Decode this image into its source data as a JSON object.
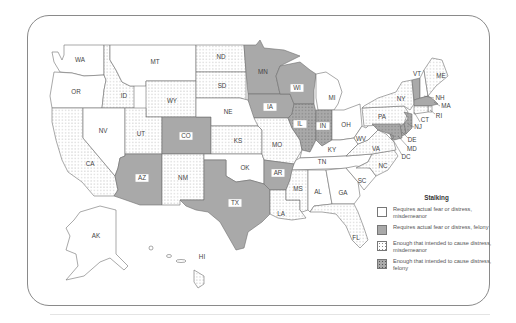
{
  "legend": {
    "title": "Stalking",
    "items": [
      {
        "key": "white",
        "label": "Requires actual fear or distress, misdemeanor"
      },
      {
        "key": "gray",
        "label": "Requires actual fear or distress, felony"
      },
      {
        "key": "dot",
        "label": "Enough that intended to cause distress, misdemeanor"
      },
      {
        "key": "graydot",
        "label": "Enough that intended to cause distress, felony"
      }
    ]
  },
  "colors": {
    "white": "#ffffff",
    "gray": "#a9a9a9",
    "dot_fill": "#8a8a8a",
    "border": "#6f6f6f",
    "frame": "#8a8a8a"
  },
  "states": {
    "WA": "white",
    "OR": "white",
    "MT": "white",
    "NV": "white",
    "NE": "white",
    "OK": "white",
    "MI": "white",
    "OH": "white",
    "KY": "white",
    "TN": "white",
    "WV": "white",
    "AL": "white",
    "GA": "white",
    "SC": "white",
    "NH": "white",
    "AK": "white",
    "MN": "gray",
    "WI": "gray",
    "IA": "gray",
    "CO": "gray",
    "AZ": "gray",
    "TX": "gray",
    "AR": "gray",
    "VT": "gray",
    "MA": "gray",
    "ID": "dot",
    "WY": "dot",
    "UT": "dot",
    "ND": "dot",
    "SD": "dot",
    "KS": "dot",
    "MO": "dot",
    "NM": "dot",
    "CA": "dot",
    "MS": "dot",
    "LA": "dot",
    "FL": "dot",
    "PA": "dot",
    "NY": "dot",
    "VA": "dot",
    "NC": "dot",
    "ME": "dot",
    "CT": "dot",
    "RI": "dot",
    "HI": "dot",
    "IL": "graydot",
    "IN": "graydot",
    "NJ": "graydot",
    "DE": "graydot",
    "MD": "graydot",
    "DC": "graydot"
  },
  "labels": {
    "WA": "WA",
    "OR": "OR",
    "CA": "CA",
    "ID": "ID",
    "NV": "NV",
    "MT": "MT",
    "WY": "WY",
    "UT": "UT",
    "AZ": "AZ",
    "CO": "CO",
    "NM": "NM",
    "ND": "ND",
    "SD": "SD",
    "NE": "NE",
    "KS": "KS",
    "OK": "OK",
    "TX": "TX",
    "MN": "MN",
    "IA": "IA",
    "MO": "MO",
    "AR": "AR",
    "LA": "LA",
    "WI": "WI",
    "IL": "IL",
    "MI": "MI",
    "IN": "IN",
    "OH": "OH",
    "KY": "KY",
    "TN": "TN",
    "MS": "MS",
    "AL": "AL",
    "GA": "GA",
    "FL": "FL",
    "SC": "SC",
    "NC": "NC",
    "VA": "VA",
    "WV": "WV",
    "PA": "PA",
    "NY": "NY",
    "VT": "VT",
    "NH": "NH",
    "ME": "ME",
    "MA": "MA",
    "RI": "RI",
    "CT": "CT",
    "NJ": "NJ",
    "DE": "DE",
    "MD": "MD",
    "DC": "DC",
    "AK": "AK",
    "HI": "HI"
  }
}
